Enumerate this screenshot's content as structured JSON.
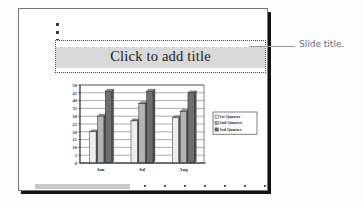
{
  "annotation": {
    "label": "Slide title.",
    "leader_icon": "leader-line-icon"
  },
  "slide": {
    "title_placeholder": {
      "text": "Click to add title",
      "band_color": "#d9d9d9",
      "border_style": "dotted"
    },
    "handles": [
      "handle-dot-1",
      "handle-dot-2",
      "handle-dot-3"
    ]
  },
  "chart_data": {
    "type": "bar",
    "title": "",
    "xlabel": "",
    "ylabel": "",
    "categories": [
      "Jun",
      "Jul",
      "Aug"
    ],
    "series": [
      {
        "name": "1st Quarter",
        "values": [
          20,
          27,
          29
        ],
        "color": "#eeeeee"
      },
      {
        "name": "2nd Quarter",
        "values": [
          30,
          38,
          33
        ],
        "color": "#b4b4b4"
      },
      {
        "name": "3rd Quarter",
        "values": [
          46,
          46,
          45
        ],
        "color": "#6e6e6e"
      }
    ],
    "ylim": [
      0,
      50
    ],
    "yticks": [
      0,
      5,
      10,
      15,
      20,
      25,
      30,
      35,
      40,
      45,
      50
    ],
    "ytick_labels": [
      "0",
      "5",
      "10",
      "15",
      "20",
      "25",
      "30",
      "35",
      "40",
      "45",
      "50"
    ],
    "grid": true,
    "legend_position": "right",
    "legend_entries": [
      "1st Quarter",
      "2nd Quarter",
      "3rd Quarter"
    ]
  },
  "bottom_ticks": [
    144,
    164,
    184,
    204,
    224,
    244,
    264
  ]
}
